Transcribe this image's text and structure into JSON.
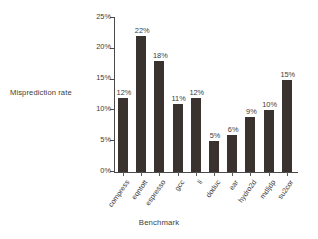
{
  "chart_data": {
    "type": "bar",
    "title": "",
    "xlabel": "Benchmark",
    "ylabel": "Misprediction rate",
    "categories": [
      "compress",
      "eqntott",
      "espresso",
      "gcc",
      "li",
      "doduc",
      "ear",
      "hydro2d",
      "mdljdp",
      "su2cor"
    ],
    "values": [
      12,
      22,
      18,
      11,
      12,
      5,
      6,
      9,
      10,
      15
    ],
    "value_labels": [
      "12%",
      "22%",
      "18%",
      "11%",
      "12%",
      "5%",
      "6%",
      "9%",
      "10%",
      "15%"
    ],
    "ylim": [
      0,
      25
    ],
    "ytick_values": [
      0,
      5,
      10,
      15,
      20,
      25
    ],
    "ytick_labels": [
      "0%",
      "5%",
      "10%",
      "15%",
      "20%",
      "25%"
    ],
    "grid": false,
    "legend": "none",
    "bar_color": "#3a322f",
    "axis_color": "#4a4a4a",
    "background_color": "#ffffff"
  }
}
